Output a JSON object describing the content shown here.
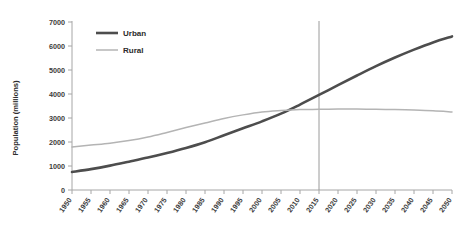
{
  "chart_data": {
    "type": "line",
    "title": "",
    "xlabel": "",
    "ylabel": "Population (millions)",
    "xlim": [
      1950,
      2050
    ],
    "ylim": [
      0,
      7000
    ],
    "ytick_step": 1000,
    "xtick_step": 5,
    "grid": false,
    "legend_position": "top-left",
    "x": [
      1950,
      1955,
      1960,
      1965,
      1970,
      1975,
      1980,
      1985,
      1990,
      1995,
      2000,
      2005,
      2010,
      2015,
      2020,
      2025,
      2030,
      2035,
      2040,
      2045,
      2050
    ],
    "categories": [
      "1950",
      "1955",
      "1960",
      "1965",
      "1970",
      "1975",
      "1980",
      "1985",
      "1990",
      "1995",
      "2000",
      "2005",
      "2010",
      "2015",
      "2020",
      "2025",
      "2030",
      "2035",
      "2040",
      "2045",
      "2050"
    ],
    "yticks": [
      "0",
      "1000",
      "2000",
      "3000",
      "4000",
      "5000",
      "6000",
      "7000"
    ],
    "series": [
      {
        "name": "Urban",
        "color": "#4d4d4d",
        "width": 2.6,
        "values": [
          750,
          870,
          1015,
          1180,
          1350,
          1540,
          1750,
          1990,
          2280,
          2570,
          2860,
          3180,
          3560,
          3960,
          4370,
          4770,
          5160,
          5520,
          5850,
          6150,
          6400
        ]
      },
      {
        "name": "Rural",
        "color": "#b4b4b4",
        "width": 1.5,
        "values": [
          1790,
          1870,
          1950,
          2060,
          2210,
          2400,
          2600,
          2790,
          2980,
          3130,
          3250,
          3310,
          3350,
          3360,
          3370,
          3370,
          3360,
          3350,
          3330,
          3300,
          3250
        ]
      }
    ],
    "annotations": [
      {
        "type": "vertical-line",
        "name": "year-marker-2015",
        "x": 2015,
        "color": "#9a9a9a",
        "y_top": 7050,
        "y_bottom": 0
      }
    ]
  },
  "legend": {
    "items": [
      {
        "label": "Urban"
      },
      {
        "label": "Rural"
      }
    ]
  },
  "axis": {
    "y_title": "Population (millions)",
    "axis_color": "#a6a6a6"
  }
}
